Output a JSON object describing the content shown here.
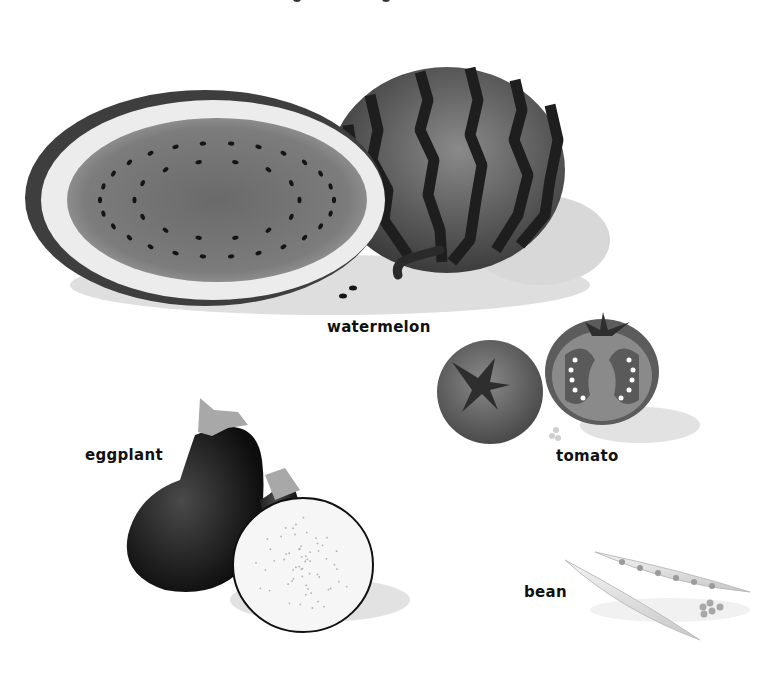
{
  "illustration": {
    "subject": "vegetables and fruits",
    "style": "grayscale clip-art",
    "items": [
      {
        "key": "watermelon",
        "label": "watermelon"
      },
      {
        "key": "tomato",
        "label": "tomato"
      },
      {
        "key": "eggplant",
        "label": "eggplant"
      },
      {
        "key": "bean",
        "label": "bean"
      }
    ]
  },
  "colors": {
    "background": "#ffffff",
    "label_text": "#111111",
    "watermelon_rind": "#5a5a5a",
    "watermelon_stripe": "#1e1e1e",
    "watermelon_flesh": "#7a7a7a",
    "watermelon_inner_rind": "#e6e6e6",
    "tomato": "#6e6e6e",
    "eggplant": "#1a1a1a",
    "eggplant_flesh": "#f6f6f6",
    "bean": "#e4e4e4"
  }
}
